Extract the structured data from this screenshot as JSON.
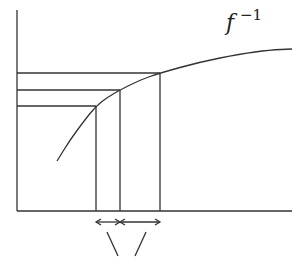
{
  "diagram": {
    "label": {
      "base": "f",
      "superscript": "−1"
    },
    "stroke_color": "#333333",
    "axes": {
      "origin": [
        17,
        211
      ],
      "y_top": 10,
      "x_right": 292
    },
    "curve_points": [
      [
        57,
        161
      ],
      [
        70,
        140
      ],
      [
        84,
        121
      ],
      [
        96,
        106
      ],
      [
        108,
        97
      ],
      [
        120,
        90
      ],
      [
        140,
        80
      ],
      [
        160,
        73
      ],
      [
        200,
        62
      ],
      [
        240,
        54
      ],
      [
        270,
        50
      ],
      [
        292,
        49
      ]
    ],
    "projections": [
      {
        "x": 96,
        "y": 106
      },
      {
        "x": 120,
        "y": 90
      },
      {
        "x": 160,
        "y": 73
      }
    ],
    "intervals": [
      {
        "from": 96,
        "to": 120,
        "y": 222
      },
      {
        "from": 120,
        "to": 160,
        "y": 222
      }
    ],
    "pointer_lines": [
      {
        "x1": 107,
        "y1": 232,
        "x2": 118,
        "y2": 256
      },
      {
        "x1": 146,
        "y1": 232,
        "x2": 135,
        "y2": 256
      }
    ]
  }
}
